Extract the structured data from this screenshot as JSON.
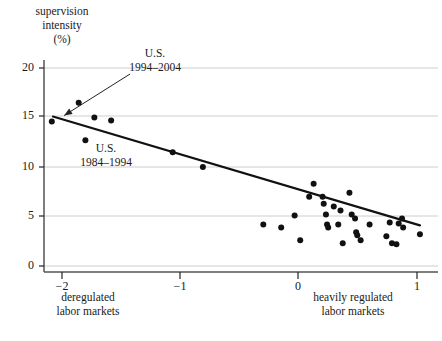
{
  "axes": {
    "y_title_lines": [
      "supervision",
      "intensity",
      "(%)"
    ],
    "y_ticks": [
      {
        "value": 20,
        "label": "20",
        "py": 68
      },
      {
        "value": 15,
        "label": "15",
        "py": 116
      },
      {
        "value": 10,
        "label": "10",
        "py": 167
      },
      {
        "value": 5,
        "label": "5",
        "py": 216
      },
      {
        "value": 0,
        "label": "0",
        "py": 266
      }
    ],
    "x_ticks": [
      {
        "value": -2,
        "label": "−2",
        "px": 62
      },
      {
        "value": -1,
        "label": "−1",
        "px": 180
      },
      {
        "value": 0,
        "label": "0",
        "px": 298
      },
      {
        "value": 1,
        "label": "1",
        "px": 417
      }
    ],
    "x_left_title_lines": [
      "deregulated",
      "labor markets"
    ],
    "x_right_title_lines": [
      "heavily regulated",
      "labor markets"
    ],
    "xlim": [
      -2.23,
      1.22
    ],
    "ylim": [
      -0.4,
      21.5
    ],
    "grid": true,
    "grid_color": "#c8c8c8",
    "axis_color": "#555555"
  },
  "annotations": [
    {
      "id": "us-1994-2004",
      "lines": [
        "U.S.",
        "1994–2004"
      ],
      "target_px": 63,
      "target_py": 101
    },
    {
      "id": "us-1984-1994",
      "lines": [
        "U.S.",
        "1984–1994"
      ],
      "target_px": null,
      "target_py": null
    }
  ],
  "chart_data": {
    "type": "scatter",
    "title": "",
    "xlabel": "deregulated labor markets — heavily regulated labor markets",
    "ylabel": "supervision intensity (%)",
    "xlim": [
      -2.23,
      1.22
    ],
    "ylim": [
      0,
      21.5
    ],
    "grid": true,
    "marker_color": "#111111",
    "marker_size_px": 6,
    "points": [
      {
        "x": -2.16,
        "y": 14.6
      },
      {
        "x": -1.92,
        "y": 16.5
      },
      {
        "x": -1.78,
        "y": 15.0
      },
      {
        "x": -1.63,
        "y": 14.7
      },
      {
        "x": -1.86,
        "y": 12.7
      },
      {
        "x": -1.08,
        "y": 11.5
      },
      {
        "x": -0.81,
        "y": 10.0
      },
      {
        "x": -0.27,
        "y": 4.2
      },
      {
        "x": -0.11,
        "y": 3.9
      },
      {
        "x": 0.01,
        "y": 5.1
      },
      {
        "x": 0.06,
        "y": 2.6
      },
      {
        "x": 0.14,
        "y": 7.0
      },
      {
        "x": 0.18,
        "y": 8.3
      },
      {
        "x": 0.26,
        "y": 7.0
      },
      {
        "x": 0.27,
        "y": 6.3
      },
      {
        "x": 0.29,
        "y": 5.2
      },
      {
        "x": 0.3,
        "y": 4.2
      },
      {
        "x": 0.31,
        "y": 3.9
      },
      {
        "x": 0.36,
        "y": 6.0
      },
      {
        "x": 0.4,
        "y": 4.2
      },
      {
        "x": 0.42,
        "y": 5.6
      },
      {
        "x": 0.44,
        "y": 2.3
      },
      {
        "x": 0.5,
        "y": 7.4
      },
      {
        "x": 0.52,
        "y": 5.2
      },
      {
        "x": 0.55,
        "y": 4.8
      },
      {
        "x": 0.56,
        "y": 3.4
      },
      {
        "x": 0.57,
        "y": 3.1
      },
      {
        "x": 0.6,
        "y": 2.6
      },
      {
        "x": 0.68,
        "y": 4.2
      },
      {
        "x": 0.83,
        "y": 3.0
      },
      {
        "x": 0.86,
        "y": 4.4
      },
      {
        "x": 0.88,
        "y": 2.3
      },
      {
        "x": 0.92,
        "y": 2.2
      },
      {
        "x": 0.94,
        "y": 4.3
      },
      {
        "x": 0.97,
        "y": 4.8
      },
      {
        "x": 0.98,
        "y": 3.9
      },
      {
        "x": 1.13,
        "y": 3.2
      }
    ],
    "fit_line": {
      "name": "regression line",
      "x_start": -2.15,
      "y_start": 15.1,
      "x_end": 1.13,
      "y_end": 4.1,
      "color": "#111111",
      "width_px": 2.2
    },
    "leader_line": {
      "from_x": -1.46,
      "from_y": 19.4,
      "to_x": -2.05,
      "to_y": 15.2,
      "arrow": true
    }
  }
}
